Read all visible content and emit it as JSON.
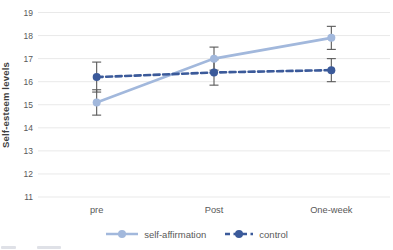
{
  "chart_data": {
    "type": "line",
    "title": "",
    "categories": [
      "pre",
      "Post",
      "One-week"
    ],
    "series": [
      {
        "name": "self-affirmation",
        "values": [
          15.1,
          17.0,
          17.9
        ],
        "errors": [
          0.55,
          0.5,
          0.5
        ],
        "color": "#a2b8dc",
        "style": "solid"
      },
      {
        "name": "control",
        "values": [
          16.2,
          16.4,
          16.5
        ],
        "errors": [
          0.65,
          0.55,
          0.5
        ],
        "color": "#3b5a9a",
        "style": "dashed"
      }
    ],
    "xlabel": "",
    "ylabel": "Self-esteem levels",
    "ylim": [
      11,
      19
    ],
    "yticks": [
      11,
      12,
      13,
      14,
      15,
      16,
      17,
      18,
      19
    ],
    "grid": true,
    "legend_position": "bottom",
    "colors": {
      "gridline": "#e9e9e9",
      "tick_label": "#595959",
      "category_label": "#595959",
      "axis_title": "#3f3f3f",
      "error_bar": "#595959",
      "background": "#ffffff"
    }
  }
}
